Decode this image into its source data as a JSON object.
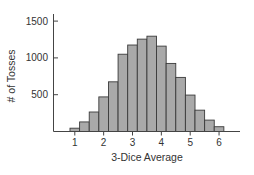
{
  "chart_data": {
    "type": "bar",
    "subtype": "histogram",
    "title": "",
    "xlabel": "3-Dice Average",
    "ylabel": "# of Tosses",
    "x": [
      1.0,
      1.333,
      1.667,
      2.0,
      2.333,
      2.667,
      3.0,
      3.333,
      3.667,
      4.0,
      4.333,
      4.667,
      5.0,
      5.333,
      5.667,
      6.0
    ],
    "values": [
      45,
      130,
      265,
      470,
      675,
      1050,
      1175,
      1255,
      1295,
      1160,
      925,
      735,
      495,
      290,
      155,
      65
    ],
    "xticks": [
      1,
      2,
      3,
      4,
      5,
      6
    ],
    "xtick_labels": [
      "1",
      "2",
      "3",
      "4",
      "5",
      "6"
    ],
    "yticks": [
      500,
      1000,
      1500
    ],
    "ytick_labels": [
      "500",
      "1000",
      "1500"
    ],
    "xlim": [
      0.3,
      6.8
    ],
    "ylim": [
      0,
      1500
    ],
    "grid": false,
    "legend": null,
    "bar_color": "#a9a9a9",
    "edge_color": "#3a3a3a"
  }
}
